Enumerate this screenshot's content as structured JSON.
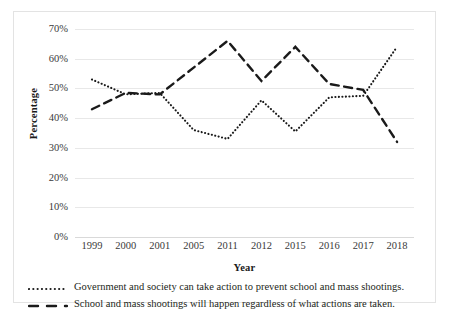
{
  "chart_data": {
    "type": "line",
    "title": "",
    "xlabel": "Year",
    "ylabel": "Percentage",
    "categories": [
      "1999",
      "2000",
      "2001",
      "2005",
      "2011",
      "2012",
      "2015",
      "2016",
      "2017",
      "2018"
    ],
    "ylim": [
      0,
      70
    ],
    "ytick_labels": [
      "0%",
      "10%",
      "20%",
      "30%",
      "40%",
      "50%",
      "60%",
      "70%"
    ],
    "ytick_values": [
      0,
      10,
      20,
      30,
      40,
      50,
      60,
      70
    ],
    "grid": true,
    "legend_position": "bottom",
    "series": [
      {
        "name": "Government and society can take action to prevent school and mass shootings.",
        "style": "dotted",
        "color": "#1a1a1a",
        "values": [
          53,
          48,
          48.5,
          36,
          33,
          46,
          35.5,
          47,
          47.5,
          64
        ]
      },
      {
        "name": "School and mass shootings will happen regardless of what actions are taken.",
        "style": "dashed",
        "color": "#1a1a1a",
        "values": [
          43,
          48.5,
          48,
          57,
          66,
          52.5,
          64,
          51.5,
          49.5,
          32
        ]
      }
    ]
  },
  "axes": {
    "y_title": "Percentage",
    "x_title": "Year"
  },
  "legend": {
    "entries": [
      {
        "marker": "dotted-line-icon",
        "label": "Government and society can take action to prevent school and mass shootings."
      },
      {
        "marker": "dashed-line-icon",
        "label": "School and mass shootings will happen regardless of what actions are taken."
      }
    ]
  }
}
